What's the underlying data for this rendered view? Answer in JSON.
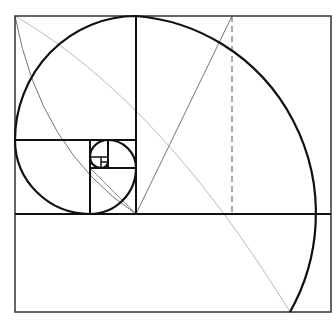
{
  "diagram": {
    "colors": {
      "stroke": "#111111",
      "guide": "#bbbbbb",
      "guide_dark": "#777777",
      "background": "#ffffff"
    },
    "frame": {
      "x": 15,
      "y": 16,
      "w": 316,
      "h": 296
    },
    "squares": [
      {
        "x": 136,
        "y": 16,
        "w": 195,
        "h": 198
      },
      {
        "x": 15,
        "y": 16,
        "w": 121,
        "h": 124
      },
      {
        "x": 15,
        "y": 140,
        "w": 75,
        "h": 74
      },
      {
        "x": 90,
        "y": 168,
        "w": 46,
        "h": 46
      },
      {
        "x": 90,
        "y": 140,
        "w": 46,
        "h": 28
      },
      {
        "x": 90,
        "y": 151,
        "w": 18,
        "h": 17
      }
    ],
    "dashed_line": {
      "x": 232,
      "y1": 16,
      "y2": 214
    }
  }
}
